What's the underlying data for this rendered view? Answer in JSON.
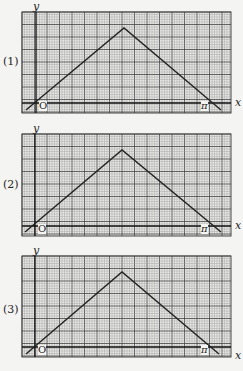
{
  "figure": {
    "panels": [
      {
        "number_label": "(1)",
        "y_label": "y",
        "x_label": "x",
        "origin_label": "O",
        "pi_label": "π"
      },
      {
        "number_label": "(2)",
        "y_label": "y",
        "x_label": "x",
        "origin_label": "O",
        "pi_label": "π"
      },
      {
        "number_label": "(3)",
        "y_label": "y",
        "x_label": "x",
        "origin_label": "O",
        "pi_label": "π"
      }
    ]
  },
  "colors": {
    "paper": "#f4f4f2",
    "grid_minor": "#9a9a9a",
    "grid_major": "#444444",
    "curve": "#222222"
  },
  "chart_data": [
    {
      "type": "line",
      "title": "(1)",
      "xlabel": "x",
      "ylabel": "y",
      "x": [
        0,
        1.5708,
        3.1416
      ],
      "values": [
        0,
        1.5708,
        0
      ],
      "xlim": [
        -0.3,
        3.4
      ],
      "grid": true,
      "annotations": [
        "O",
        "π"
      ]
    },
    {
      "type": "line",
      "title": "(2)",
      "xlabel": "x",
      "ylabel": "y",
      "x": [
        0,
        1.5708,
        3.1416
      ],
      "values": [
        0,
        1.5708,
        0
      ],
      "xlim": [
        -0.3,
        3.4
      ],
      "grid": true,
      "annotations": [
        "O",
        "π"
      ]
    },
    {
      "type": "line",
      "title": "(3)",
      "xlabel": "x",
      "ylabel": "y",
      "x": [
        0,
        1.5708,
        3.1416
      ],
      "values": [
        0,
        1.5708,
        0
      ],
      "xlim": [
        -0.3,
        3.4
      ],
      "grid": true,
      "annotations": [
        "O",
        "π"
      ]
    }
  ]
}
